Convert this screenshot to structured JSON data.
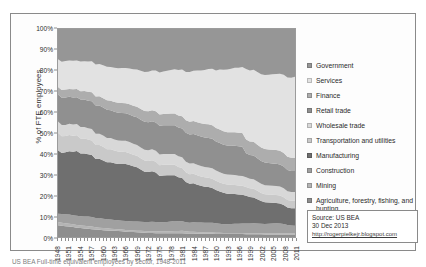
{
  "figure": {
    "caption": "US BEA Full-time equivalent employees by sector, 1948-2011"
  },
  "source_box": {
    "lines": [
      "Source: US BEA",
      "30 Dec 2013",
      "http://rogerpielkejr.blogspot.com"
    ]
  },
  "chart_data": {
    "type": "area",
    "title": "",
    "subtitle": "",
    "xlabel": "",
    "ylabel": "% of FTE employees",
    "ylim": [
      0,
      100
    ],
    "ytick_labels": [
      "0%",
      "10%",
      "20%",
      "30%",
      "40%",
      "50%",
      "60%",
      "70%",
      "80%",
      "90%",
      "100%"
    ],
    "ytick_values": [
      0,
      10,
      20,
      30,
      40,
      50,
      60,
      70,
      80,
      90,
      100
    ],
    "grid": false,
    "legend_position": "right",
    "stacked": true,
    "stack_order_bottom_to_top": [
      "Agriculture, forestry, fishing, and hunting",
      "Mining",
      "Construction",
      "Manufacturing",
      "Transportation and utilities",
      "Wholesale trade",
      "Retail trade",
      "Finance",
      "Services",
      "Government"
    ],
    "x": [
      1948,
      1949,
      1950,
      1951,
      1952,
      1953,
      1954,
      1955,
      1956,
      1957,
      1958,
      1959,
      1960,
      1961,
      1962,
      1963,
      1964,
      1965,
      1966,
      1967,
      1968,
      1969,
      1970,
      1971,
      1972,
      1973,
      1974,
      1975,
      1976,
      1977,
      1978,
      1979,
      1980,
      1981,
      1982,
      1983,
      1984,
      1985,
      1986,
      1987,
      1988,
      1989,
      1990,
      1991,
      1992,
      1993,
      1994,
      1995,
      1996,
      1997,
      1998,
      1999,
      2000,
      2001,
      2002,
      2003,
      2004,
      2005,
      2006,
      2007,
      2008,
      2009,
      2010,
      2011
    ],
    "xtick_labels": [
      "1948",
      "1951",
      "1954",
      "1957",
      "1960",
      "1963",
      "1966",
      "1969",
      "1972",
      "1975",
      "1978",
      "1981",
      "1984",
      "1987",
      "1990",
      "1993",
      "1996",
      "1999",
      "2002",
      "2005",
      "2008",
      "2011"
    ],
    "xtick_values": [
      1948,
      1951,
      1954,
      1957,
      1960,
      1963,
      1966,
      1969,
      1972,
      1975,
      1978,
      1981,
      1984,
      1987,
      1990,
      1993,
      1996,
      1999,
      2002,
      2005,
      2008,
      2011
    ],
    "series": [
      {
        "name": "Agriculture, forestry, fishing, and hunting",
        "color": "#8e8e8e",
        "values": [
          5.6,
          5.4,
          5.2,
          5.0,
          4.8,
          4.5,
          4.3,
          4.1,
          3.9,
          3.7,
          3.5,
          3.4,
          3.2,
          3.1,
          3.0,
          2.9,
          2.8,
          2.7,
          2.5,
          2.4,
          2.3,
          2.2,
          2.1,
          2.0,
          1.9,
          1.9,
          1.8,
          1.8,
          1.8,
          1.8,
          1.8,
          1.8,
          1.8,
          1.8,
          1.7,
          1.6,
          1.6,
          1.5,
          1.5,
          1.5,
          1.5,
          1.5,
          1.4,
          1.4,
          1.4,
          1.4,
          1.4,
          1.4,
          1.4,
          1.4,
          1.3,
          1.3,
          1.3,
          1.3,
          1.3,
          1.2,
          1.2,
          1.2,
          1.2,
          1.2,
          1.2,
          1.2,
          1.2,
          1.2
        ]
      },
      {
        "name": "Mining",
        "color": "#b4b4b4",
        "values": [
          1.6,
          1.5,
          1.4,
          1.4,
          1.3,
          1.3,
          1.2,
          1.2,
          1.2,
          1.2,
          1.1,
          1.0,
          1.0,
          1.0,
          0.9,
          0.9,
          0.9,
          0.8,
          0.8,
          0.8,
          0.8,
          0.8,
          0.8,
          0.8,
          0.8,
          0.8,
          0.8,
          0.9,
          0.9,
          0.9,
          0.9,
          1.0,
          1.0,
          1.1,
          1.0,
          0.9,
          0.9,
          0.8,
          0.7,
          0.6,
          0.6,
          0.6,
          0.6,
          0.6,
          0.5,
          0.5,
          0.5,
          0.5,
          0.5,
          0.5,
          0.5,
          0.5,
          0.5,
          0.5,
          0.5,
          0.5,
          0.5,
          0.5,
          0.5,
          0.6,
          0.6,
          0.6,
          0.6,
          0.6
        ]
      },
      {
        "name": "Construction",
        "color": "#a0a0a0",
        "values": [
          4.0,
          4.1,
          4.3,
          4.4,
          4.4,
          4.4,
          4.4,
          4.5,
          4.6,
          4.5,
          4.4,
          4.5,
          4.4,
          4.3,
          4.3,
          4.2,
          4.2,
          4.2,
          4.2,
          4.2,
          4.2,
          4.3,
          4.3,
          4.3,
          4.4,
          4.5,
          4.5,
          4.3,
          4.3,
          4.4,
          4.6,
          4.7,
          4.6,
          4.5,
          4.2,
          4.2,
          4.4,
          4.5,
          4.6,
          4.6,
          4.6,
          4.6,
          4.5,
          4.2,
          4.1,
          4.1,
          4.2,
          4.3,
          4.4,
          4.5,
          4.6,
          4.7,
          4.8,
          4.8,
          4.7,
          4.7,
          4.8,
          4.9,
          5.0,
          4.8,
          4.5,
          4.1,
          3.8,
          3.7
        ]
      },
      {
        "name": "Manufacturing",
        "color": "#6f6f6f",
        "values": [
          30.5,
          29.4,
          29.8,
          30.4,
          30.5,
          31.2,
          29.8,
          30.0,
          29.7,
          29.2,
          27.8,
          28.0,
          27.5,
          26.8,
          27.0,
          26.8,
          26.5,
          26.6,
          26.9,
          26.5,
          26.0,
          25.6,
          24.6,
          23.7,
          23.5,
          23.8,
          23.3,
          21.8,
          22.0,
          22.0,
          21.8,
          21.6,
          20.8,
          20.3,
          19.0,
          18.4,
          18.4,
          17.8,
          17.3,
          17.0,
          16.8,
          16.4,
          15.9,
          15.2,
          14.8,
          14.4,
          14.2,
          14.0,
          13.7,
          13.5,
          13.2,
          12.7,
          12.4,
          11.7,
          11.1,
          10.7,
          10.4,
          10.2,
          10.0,
          9.7,
          9.3,
          8.6,
          8.5,
          8.5
        ]
      },
      {
        "name": "Transportation and utilities",
        "color": "#c9c9c9",
        "values": [
          8.4,
          8.0,
          7.8,
          7.8,
          7.7,
          7.5,
          7.2,
          7.1,
          7.0,
          6.9,
          6.6,
          6.5,
          6.4,
          6.2,
          6.1,
          6.0,
          5.9,
          5.8,
          5.7,
          5.6,
          5.5,
          5.4,
          5.3,
          5.2,
          5.2,
          5.2,
          5.1,
          5.0,
          5.0,
          4.9,
          4.9,
          4.9,
          4.8,
          4.7,
          4.6,
          4.5,
          4.5,
          4.5,
          4.4,
          4.4,
          4.4,
          4.4,
          4.4,
          4.3,
          4.3,
          4.3,
          4.3,
          4.3,
          4.3,
          4.3,
          4.2,
          4.2,
          4.2,
          4.1,
          4.0,
          3.9,
          3.9,
          3.9,
          3.9,
          3.9,
          3.8,
          3.7,
          3.7,
          3.7
        ]
      },
      {
        "name": "Wholesale trade",
        "color": "#d8d8d8",
        "values": [
          5.4,
          5.4,
          5.4,
          5.4,
          5.4,
          5.4,
          5.4,
          5.4,
          5.4,
          5.4,
          5.3,
          5.3,
          5.3,
          5.3,
          5.3,
          5.2,
          5.2,
          5.2,
          5.2,
          5.2,
          5.1,
          5.1,
          5.1,
          5.1,
          5.1,
          5.1,
          5.1,
          5.1,
          5.1,
          5.1,
          5.1,
          5.1,
          5.1,
          5.1,
          5.0,
          5.0,
          5.0,
          5.0,
          4.9,
          4.9,
          4.9,
          4.9,
          4.8,
          4.8,
          4.7,
          4.7,
          4.7,
          4.7,
          4.6,
          4.6,
          4.6,
          4.6,
          4.6,
          4.5,
          4.5,
          4.4,
          4.4,
          4.4,
          4.4,
          4.4,
          4.4,
          4.3,
          4.3,
          4.3
        ]
      },
      {
        "name": "Retail trade",
        "color": "#909090",
        "values": [
          13.0,
          13.2,
          13.2,
          13.0,
          13.0,
          12.9,
          13.1,
          13.1,
          13.1,
          13.1,
          13.2,
          13.2,
          13.2,
          13.2,
          13.1,
          13.1,
          13.1,
          13.1,
          13.0,
          13.0,
          13.0,
          13.0,
          13.1,
          13.2,
          13.2,
          13.2,
          13.3,
          13.5,
          13.5,
          13.5,
          13.5,
          13.5,
          13.5,
          13.5,
          13.6,
          13.7,
          13.7,
          13.8,
          13.9,
          13.9,
          13.9,
          13.9,
          13.9,
          13.8,
          13.7,
          13.7,
          13.8,
          13.8,
          13.8,
          13.7,
          11.5,
          11.4,
          11.4,
          11.3,
          11.2,
          11.1,
          11.1,
          11.0,
          10.9,
          10.8,
          10.6,
          10.4,
          10.3,
          10.3
        ]
      },
      {
        "name": "Finance",
        "color": "#adadad",
        "values": [
          3.6,
          3.7,
          3.8,
          3.8,
          3.9,
          3.9,
          4.0,
          4.1,
          4.2,
          4.2,
          4.3,
          4.4,
          4.4,
          4.5,
          4.5,
          4.6,
          4.6,
          4.7,
          4.7,
          4.8,
          4.9,
          5.0,
          5.0,
          5.1,
          5.2,
          5.2,
          5.3,
          5.3,
          5.4,
          5.5,
          5.6,
          5.6,
          5.7,
          5.8,
          5.9,
          6.0,
          6.1,
          6.2,
          6.3,
          6.4,
          6.4,
          6.4,
          6.4,
          6.3,
          6.3,
          6.3,
          6.3,
          6.4,
          6.4,
          6.5,
          6.5,
          6.5,
          6.6,
          6.6,
          6.6,
          6.6,
          6.6,
          6.7,
          6.7,
          6.7,
          6.6,
          6.6,
          6.5,
          6.5
        ]
      },
      {
        "name": "Services",
        "color": "#e2e2e2",
        "values": [
          13.3,
          13.6,
          13.7,
          13.6,
          13.7,
          13.7,
          14.1,
          14.2,
          14.4,
          14.6,
          15.1,
          15.2,
          15.5,
          15.8,
          15.9,
          16.1,
          16.3,
          16.4,
          16.6,
          16.9,
          17.2,
          17.5,
          18.0,
          18.3,
          18.6,
          18.8,
          19.2,
          19.8,
          20.0,
          20.2,
          20.5,
          20.8,
          21.4,
          21.9,
          22.8,
          23.4,
          23.7,
          24.3,
          24.9,
          25.4,
          26.0,
          26.6,
          27.4,
          28.3,
          29.0,
          29.5,
          29.9,
          30.3,
          30.7,
          31.1,
          33.6,
          34.2,
          34.6,
          35.3,
          35.9,
          36.4,
          36.7,
          37.0,
          37.3,
          37.6,
          38.2,
          39.0,
          39.2,
          39.5
        ]
      },
      {
        "name": "Government",
        "color": "#969696",
        "values": [
          14.6,
          15.7,
          15.4,
          15.2,
          15.3,
          15.2,
          15.5,
          15.3,
          15.5,
          15.2,
          16.7,
          16.5,
          17.1,
          17.8,
          17.9,
          18.3,
          18.5,
          18.4,
          18.4,
          18.6,
          19.0,
          19.1,
          19.7,
          20.3,
          20.1,
          19.5,
          19.6,
          20.5,
          20.0,
          19.7,
          19.3,
          19.0,
          19.3,
          19.1,
          20.2,
          20.3,
          19.7,
          19.6,
          19.5,
          19.3,
          18.9,
          18.7,
          19.7,
          19.1,
          19.2,
          19.1,
          18.7,
          18.3,
          18.2,
          17.9,
          19.0,
          19.9,
          19.6,
          20.9,
          22.2,
          22.5,
          22.4,
          22.2,
          22.0,
          21.8,
          22.4,
          23.8,
          23.9,
          23.4
        ]
      }
    ],
    "legend_entries": [
      {
        "label": "Government",
        "color": "#969696"
      },
      {
        "label": "Services",
        "color": "#e2e2e2"
      },
      {
        "label": "Finance",
        "color": "#adadad"
      },
      {
        "label": "Retail trade",
        "color": "#909090"
      },
      {
        "label": "Wholesale trade",
        "color": "#d8d8d8"
      },
      {
        "label": "Transportation and utilities",
        "color": "#c9c9c9"
      },
      {
        "label": "Manufacturing",
        "color": "#6f6f6f"
      },
      {
        "label": "Construction",
        "color": "#a0a0a0"
      },
      {
        "label": "Mining",
        "color": "#b4b4b4"
      },
      {
        "label": "Agriculture, forestry, fishing, and hunting",
        "color": "#8e8e8e"
      }
    ]
  }
}
